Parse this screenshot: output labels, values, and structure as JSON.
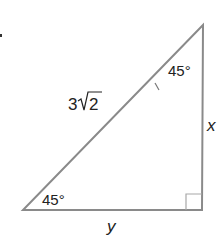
{
  "diagram": {
    "type": "right-triangle",
    "vertices": {
      "top": {
        "x": 203,
        "y": 25
      },
      "bottom_left": {
        "x": 23,
        "y": 210
      },
      "right_angle": {
        "x": 202,
        "y": 210
      }
    },
    "labels": {
      "hypotenuse": "3√2",
      "hypotenuse_coefficient": "3",
      "hypotenuse_radicand": "2",
      "vertical_leg": "x",
      "horizontal_leg": "y",
      "top_angle": "45°",
      "bottom_left_angle": "45°"
    },
    "colors": {
      "stroke": "#8a8a8a",
      "text": "#222222"
    }
  }
}
